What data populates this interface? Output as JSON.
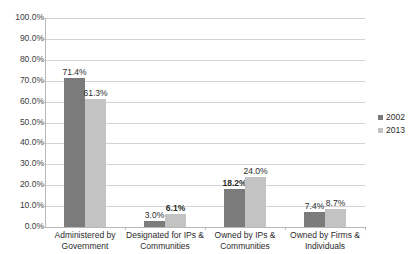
{
  "chart_data": {
    "type": "bar",
    "title": "",
    "xlabel": "",
    "ylabel": "",
    "ylim": [
      0,
      100
    ],
    "ytick_labels": [
      "100.0%",
      "90.0%",
      "80.0%",
      "70.0%",
      "60.0%",
      "50.0%",
      "40.0%",
      "30.0%",
      "20.0%",
      "10.0%",
      "0.0%"
    ],
    "ytick_values": [
      100,
      90,
      80,
      70,
      60,
      50,
      40,
      30,
      20,
      10,
      0
    ],
    "grid": true,
    "legend_position": "right",
    "categories": [
      "Administered by Government",
      "Designated for IPs & Communities",
      "Owned by IPs & Communities",
      "Owned by Firms & Individuals"
    ],
    "category_lines": [
      [
        "Administered by",
        "Government"
      ],
      [
        "Designated for IPs &",
        "Communities"
      ],
      [
        "Owned by IPs &",
        "Communities"
      ],
      [
        "Owned by Firms &",
        "Individuals"
      ]
    ],
    "series": [
      {
        "name": "2002",
        "color": "#7b7b7b",
        "values": [
          71.4,
          3.0,
          18.2,
          7.4
        ],
        "labels": [
          "71.4%",
          "3.0%",
          "18.2%",
          "7.4%"
        ],
        "label_bold": [
          false,
          false,
          true,
          false
        ]
      },
      {
        "name": "2013",
        "color": "#c3c3c3",
        "values": [
          61.3,
          6.1,
          24.0,
          8.7
        ],
        "labels": [
          "61.3%",
          "6.1%",
          "24.0%",
          "8.7%"
        ],
        "label_bold": [
          false,
          true,
          false,
          false
        ]
      }
    ]
  },
  "legend": {
    "items": [
      {
        "label": "2002",
        "color": "#7b7b7b"
      },
      {
        "label": "2013",
        "color": "#c3c3c3"
      }
    ]
  },
  "colors": {
    "series_2002": "#7b7b7b",
    "series_2013": "#c3c3c3",
    "gridline": "#d2d2d2",
    "axis": "#b8b8b8",
    "text": "#2b2b2b",
    "background": "#ffffff"
  }
}
